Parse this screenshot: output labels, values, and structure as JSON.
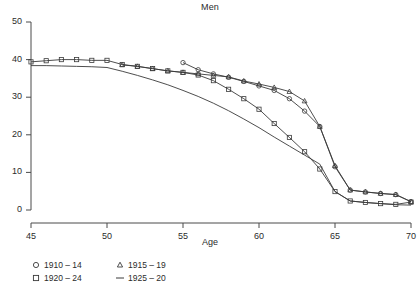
{
  "chart_data": {
    "type": "line",
    "title": "Men",
    "xlabel": "Age",
    "ylabel": "",
    "xlim": [
      45,
      70
    ],
    "ylim": [
      0,
      50
    ],
    "xticks": [
      45,
      50,
      55,
      60,
      65,
      70
    ],
    "yticks": [
      0,
      10,
      20,
      30,
      40,
      50
    ],
    "grid": false,
    "legend_position": "below-left",
    "x": [
      45,
      46,
      47,
      48,
      49,
      50,
      51,
      52,
      53,
      54,
      55,
      56,
      57,
      58,
      59,
      60,
      61,
      62,
      63,
      64,
      65,
      66,
      67,
      68,
      69,
      70
    ],
    "series": [
      {
        "name": "1910 – 14",
        "marker": "circle",
        "color": "#3a3a3a",
        "x": [
          55,
          56,
          57,
          58,
          59,
          60,
          61,
          62,
          63,
          64,
          65,
          66,
          67,
          68,
          69,
          70
        ],
        "values": [
          39.2,
          37.3,
          36.2,
          35.3,
          34.2,
          33.0,
          31.8,
          29.6,
          26.3,
          22.2,
          11.5,
          5.3,
          4.8,
          4.4,
          4.1,
          2.2
        ]
      },
      {
        "name": "1915 – 19",
        "marker": "triangle",
        "color": "#3a3a3a",
        "x": [
          51,
          52,
          53,
          54,
          55,
          56,
          57,
          58,
          59,
          60,
          61,
          62,
          63,
          64,
          65,
          66,
          67,
          68,
          69,
          70
        ],
        "values": [
          38.6,
          38.2,
          37.6,
          37.0,
          36.6,
          36.2,
          35.8,
          35.4,
          34.3,
          33.5,
          32.6,
          31.5,
          29.0,
          22.2,
          11.8,
          5.3,
          4.8,
          4.4,
          4.1,
          2.2
        ]
      },
      {
        "name": "1920 – 24",
        "marker": "square",
        "color": "#3a3a3a",
        "x": [
          45,
          46,
          47,
          48,
          49,
          50,
          51,
          52,
          53,
          54,
          55,
          56,
          57,
          58,
          59,
          60,
          61,
          62,
          63,
          64,
          65,
          66,
          67,
          68,
          69,
          70
        ],
        "values": [
          39.4,
          39.7,
          40.0,
          40.0,
          39.8,
          39.8,
          38.7,
          38.2,
          37.6,
          37.0,
          36.6,
          35.9,
          34.4,
          32.1,
          29.6,
          26.8,
          23.0,
          19.3,
          15.5,
          10.9,
          4.9,
          2.4,
          2.0,
          1.7,
          1.5,
          2.1
        ]
      },
      {
        "name": "1925 – 20",
        "marker": "line",
        "color": "#3a3a3a",
        "x": [
          45,
          46,
          47,
          48,
          49,
          50,
          51,
          52,
          53,
          54,
          55,
          56,
          57,
          58,
          59,
          60,
          61,
          62,
          63,
          64,
          65,
          66,
          67,
          68,
          69,
          70
        ],
        "values": [
          38.4,
          38.4,
          38.3,
          38.2,
          38.1,
          37.9,
          36.9,
          35.8,
          34.6,
          33.3,
          31.8,
          30.2,
          28.4,
          26.4,
          24.2,
          21.9,
          19.4,
          17.0,
          14.6,
          12.2,
          4.9,
          2.4,
          2.0,
          1.7,
          1.4,
          1.3
        ]
      }
    ]
  },
  "axis": {
    "ytick_labels": [
      "0",
      "10",
      "20",
      "30",
      "40",
      "50"
    ],
    "xtick_labels": [
      "45",
      "50",
      "55",
      "60",
      "65",
      "70"
    ],
    "x_title": "Age"
  },
  "title": {
    "text": "Men"
  },
  "legend": {
    "items": [
      {
        "label": "1910 – 14",
        "marker": "circle-marker"
      },
      {
        "label": "1915 – 19",
        "marker": "triangle-marker"
      },
      {
        "label": "1920 – 24",
        "marker": "square-marker"
      },
      {
        "label": "1925 – 20",
        "marker": "line-marker"
      }
    ]
  }
}
